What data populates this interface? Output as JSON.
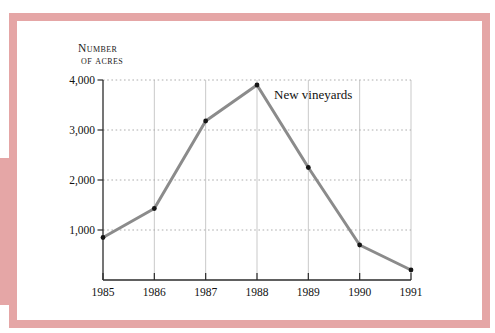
{
  "figure": {
    "frame_color": "#E5A6A6",
    "background_color": "#FFFFFF"
  },
  "chart_data": {
    "type": "line",
    "title": "",
    "ylabel_lines": [
      "Number",
      "of acres"
    ],
    "annotation": "New vineyards",
    "categories": [
      "1985",
      "1986",
      "1987",
      "1988",
      "1989",
      "1990",
      "1991"
    ],
    "series": [
      {
        "name": "New vineyards",
        "values": [
          850,
          1430,
          3180,
          3900,
          2250,
          700,
          200
        ]
      }
    ],
    "yticks": [
      {
        "value": 4000,
        "label": "4,000"
      },
      {
        "value": 3000,
        "label": "3,000"
      },
      {
        "value": 2000,
        "label": "2,000"
      },
      {
        "value": 1000,
        "label": "1,000"
      }
    ],
    "ylim": [
      0,
      4000
    ],
    "grid": "dotted-horizontal-and-light-vertical",
    "legend_position": "inline-annotation-right-of-peak",
    "colors": {
      "line": "#8B8B8B",
      "point": "#151515",
      "grid_h": "#ADADAD",
      "grid_v": "#C9C9C9",
      "axis": "#2B2B2B",
      "text": "#1A1A1A"
    }
  }
}
